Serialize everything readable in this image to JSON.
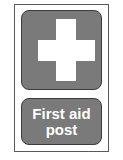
{
  "sign": {
    "symbol": "cross-icon",
    "label_line1": "First aid",
    "label_line2": "post",
    "colors": {
      "panel": "#7a7a7a",
      "symbol": "#ffffff",
      "text": "#ffffff",
      "border": "#3c3c3c"
    }
  }
}
